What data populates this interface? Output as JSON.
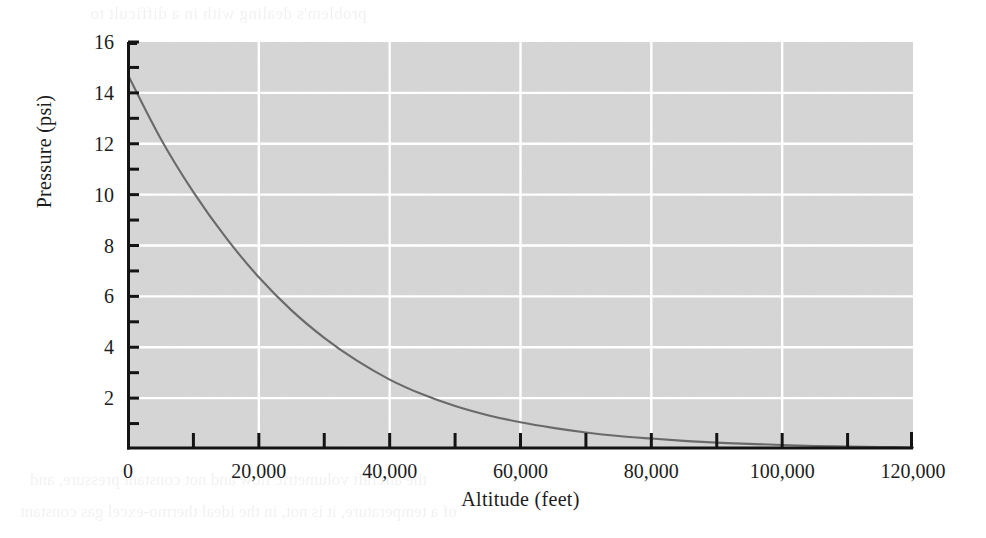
{
  "figure": {
    "background_color": "#ffffff",
    "plot_background_color": "#d6d6d6",
    "gridline_color": "#ffffff",
    "axis_color": "#141414",
    "curve_color": "#6a6a6a"
  },
  "chart_data": {
    "type": "line",
    "title": "",
    "xlabel": "Altitude (feet)",
    "ylabel": "Pressure (psi)",
    "xlim": [
      0,
      120000
    ],
    "ylim": [
      0,
      16
    ],
    "grid": true,
    "legend": "none",
    "x_major_ticks": [
      0,
      20000,
      40000,
      60000,
      80000,
      100000,
      120000
    ],
    "x_tick_labels": [
      "0",
      "20,000",
      "40,000",
      "60,000",
      "80,000",
      "100,000",
      "120,000"
    ],
    "x_minor_ticks": [
      10000,
      30000,
      50000,
      70000,
      90000,
      110000
    ],
    "y_major_ticks": [
      2,
      4,
      6,
      8,
      10,
      12,
      14,
      16
    ],
    "y_tick_labels": [
      "2",
      "4",
      "6",
      "8",
      "10",
      "12",
      "14",
      "16"
    ],
    "y_minor_ticks": [
      1,
      3,
      5,
      7,
      9,
      11,
      13,
      15
    ],
    "series": [
      {
        "name": "Atmospheric pressure",
        "x": [
          0,
          5000,
          10000,
          15000,
          20000,
          25000,
          30000,
          35000,
          40000,
          45000,
          50000,
          55000,
          60000,
          65000,
          70000,
          75000,
          80000,
          85000,
          90000,
          95000,
          100000,
          105000,
          110000,
          115000,
          120000
        ],
        "y": [
          14.7,
          12.2,
          10.1,
          8.3,
          6.75,
          5.45,
          4.37,
          3.47,
          2.73,
          2.15,
          1.69,
          1.33,
          1.05,
          0.83,
          0.65,
          0.51,
          0.41,
          0.32,
          0.25,
          0.2,
          0.16,
          0.12,
          0.1,
          0.08,
          0.06
        ]
      }
    ]
  },
  "bleed_text": {
    "top": "problem's dealing with in a difficult to",
    "row1": "a sealed against sea level pressure",
    "row2": "the cabin at a pressure of several",
    "row3": "is not same as the pressure inside",
    "row4": "which the aircraft operates at an",
    "row5": "pressure as the cabin altitude and",
    "row6": "the difference between the outside",
    "row7": "rate of change of the pressure in",
    "row8": "the aircraft cabin pressure can",
    "bottom1": "the aircraft volumetric flow and not constant pressure, and",
    "bottom2": "of a temperature, it is not, in the ideal thermo-excel gas constant"
  }
}
